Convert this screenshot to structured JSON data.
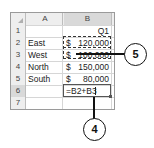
{
  "spreadsheet": {
    "column_headers": [
      "A",
      "B"
    ],
    "row_numbers": [
      "1",
      "2",
      "3",
      "4",
      "5",
      "6",
      "7"
    ],
    "rows": [
      {
        "a": "",
        "b_currency": "",
        "b_value": "Q1"
      },
      {
        "a": "East",
        "b_currency": "$",
        "b_value": "120,000"
      },
      {
        "a": "West",
        "b_currency": "$",
        "b_value": "100,000"
      },
      {
        "a": "North",
        "b_currency": "$",
        "b_value": "150,000"
      },
      {
        "a": "South",
        "b_currency": "$",
        "b_value": "80,000"
      },
      {
        "a": "",
        "b_formula": "=B2+B3"
      }
    ],
    "active_cell": "B6",
    "copied_range": "B2:B3"
  },
  "callouts": [
    {
      "number": "5",
      "target": "copied-range-B2-B3"
    },
    {
      "number": "4",
      "target": "active-cell-B6"
    }
  ]
}
